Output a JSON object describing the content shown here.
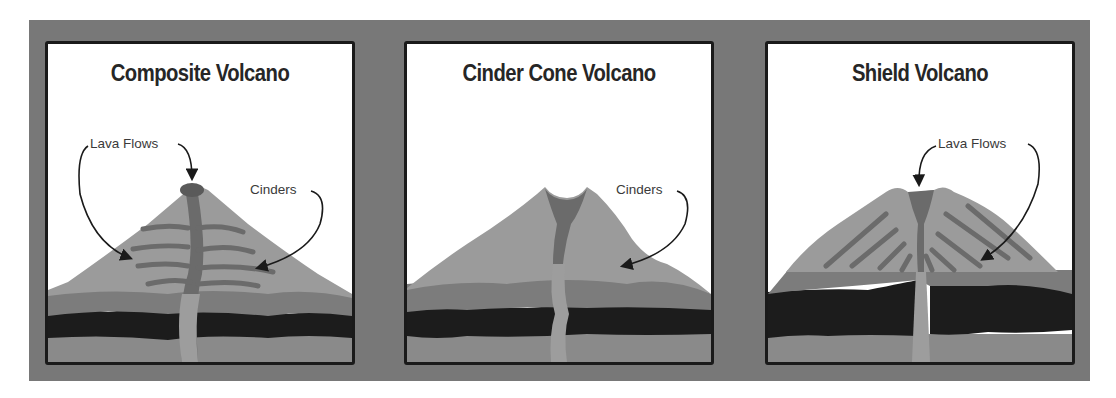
{
  "diagram": {
    "colors": {
      "frame": "#787878",
      "panel_bg": "#ffffff",
      "panel_border": "#1a1a1a",
      "cone": "#9b9b9b",
      "lava": "#6b6b6b",
      "crust_mid": "#7c7c7c",
      "crust_dark": "#1c1c1c",
      "crust_bottom": "#8a8a8a",
      "conduit": "#9d9d9d",
      "title_text": "#262626",
      "label_text": "#3a3a3a"
    },
    "panels": [
      {
        "title": "Composite Volcano",
        "labels": [
          {
            "text": "Lava Flows",
            "points_to": [
              "summit crater",
              "side lava layers"
            ]
          },
          {
            "text": "Cinders",
            "points_to": [
              "cone slope"
            ]
          }
        ]
      },
      {
        "title": "Cinder Cone Volcano",
        "labels": [
          {
            "text": "Cinders",
            "points_to": [
              "cone slope"
            ]
          }
        ]
      },
      {
        "title": "Shield Volcano",
        "labels": [
          {
            "text": "Lava Flows",
            "points_to": [
              "summit crater",
              "flank lava streaks"
            ]
          }
        ]
      }
    ]
  }
}
